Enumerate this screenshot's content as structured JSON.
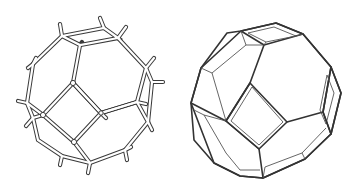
{
  "figure": {
    "left": {
      "label": "stick-model-sodalite-cage",
      "style": "ball-and-stick rods with dangling bond stubs",
      "stroke_color": "#3a3a3a"
    },
    "right": {
      "label": "solid-polyhedron-sodalite-cage",
      "style": "truncated octahedron with beveled edges",
      "stroke_color": "#333333"
    },
    "background": "#ffffff"
  }
}
